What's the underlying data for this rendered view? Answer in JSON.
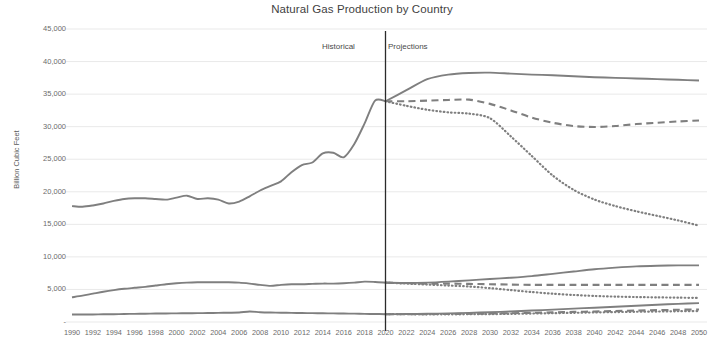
{
  "chart_data": {
    "type": "line",
    "title": "Natural Gas Production by Country",
    "xlabel": "",
    "ylabel": "Billion Cubic Feet",
    "ylim": [
      0,
      45000
    ],
    "xlim": [
      1990,
      2050
    ],
    "grid": true,
    "legend": "none",
    "y_ticks": [
      "45,000",
      "40,000",
      "35,000",
      "30,000",
      "25,000",
      "20,000",
      "15,000",
      "10,000",
      "5,000",
      "-"
    ],
    "y_tick_values": [
      45000,
      40000,
      35000,
      30000,
      25000,
      20000,
      15000,
      10000,
      5000,
      0
    ],
    "x_ticks": [
      "1990",
      "1992",
      "1994",
      "1996",
      "1998",
      "2000",
      "2002",
      "2004",
      "2006",
      "2008",
      "2010",
      "2012",
      "2014",
      "2016",
      "2018",
      "2020",
      "2022",
      "2024",
      "2026",
      "2028",
      "2030",
      "2032",
      "2034",
      "2036",
      "2038",
      "2040",
      "2042",
      "2044",
      "2046",
      "2048",
      "2050"
    ],
    "x_tick_values": [
      1990,
      1992,
      1994,
      1996,
      1998,
      2000,
      2002,
      2004,
      2006,
      2008,
      2010,
      2012,
      2014,
      2016,
      2018,
      2020,
      2022,
      2024,
      2026,
      2028,
      2030,
      2032,
      2034,
      2036,
      2038,
      2040,
      2042,
      2044,
      2046,
      2048,
      2050
    ],
    "annotations": [
      {
        "name": "historical-label",
        "text": "Historical",
        "x": 2016
      },
      {
        "name": "projections-label",
        "text": "Projections",
        "x": 2024
      },
      {
        "name": "era-divider",
        "text": "",
        "x": 2020
      }
    ],
    "divider_year": 2020,
    "line_color": "#7f7f7f",
    "grid_color": "#e9e9e9",
    "series": [
      {
        "name": "Country A historical",
        "style": "solid",
        "phase": "historical",
        "x": [
          1990,
          1991,
          1992,
          1993,
          1994,
          1995,
          1996,
          1997,
          1998,
          1999,
          2000,
          2001,
          2002,
          2003,
          2004,
          2005,
          2006,
          2007,
          2008,
          2009,
          2010,
          2011,
          2012,
          2013,
          2014,
          2015,
          2016,
          2017,
          2018,
          2019,
          2020
        ],
        "values": [
          17800,
          17700,
          17900,
          18200,
          18600,
          18900,
          19000,
          19000,
          18900,
          18800,
          19100,
          19400,
          18900,
          19000,
          18800,
          18200,
          18500,
          19300,
          20200,
          20900,
          21600,
          23000,
          24100,
          24500,
          25900,
          26000,
          25300,
          27300,
          30500,
          34000,
          33900
        ]
      },
      {
        "name": "Country A projection high",
        "style": "solid",
        "phase": "projection",
        "x": [
          2020,
          2022,
          2024,
          2026,
          2028,
          2030,
          2032,
          2034,
          2036,
          2038,
          2040,
          2042,
          2044,
          2046,
          2048,
          2050
        ],
        "values": [
          33900,
          35600,
          37300,
          38000,
          38250,
          38300,
          38150,
          38000,
          37900,
          37750,
          37600,
          37500,
          37400,
          37300,
          37200,
          37100
        ]
      },
      {
        "name": "Country A projection mid",
        "style": "dashed",
        "phase": "projection",
        "x": [
          2020,
          2022,
          2024,
          2026,
          2028,
          2030,
          2032,
          2034,
          2036,
          2038,
          2040,
          2042,
          2044,
          2046,
          2048,
          2050
        ],
        "values": [
          33900,
          33900,
          34000,
          34100,
          34150,
          33500,
          32500,
          31400,
          30600,
          30100,
          29950,
          30100,
          30400,
          30600,
          30800,
          30950
        ]
      },
      {
        "name": "Country A projection low",
        "style": "dotted",
        "phase": "projection",
        "x": [
          2020,
          2022,
          2024,
          2026,
          2028,
          2030,
          2032,
          2034,
          2036,
          2038,
          2040,
          2042,
          2044,
          2046,
          2048,
          2050
        ],
        "values": [
          33900,
          33200,
          32600,
          32200,
          32000,
          31300,
          28500,
          25500,
          22500,
          20300,
          18800,
          17800,
          17000,
          16300,
          15600,
          14800
        ]
      },
      {
        "name": "Country B historical",
        "style": "solid",
        "phase": "historical",
        "x": [
          1990,
          1991,
          1992,
          1993,
          1994,
          1995,
          1996,
          1997,
          1998,
          1999,
          2000,
          2001,
          2002,
          2003,
          2004,
          2005,
          2006,
          2007,
          2008,
          2009,
          2010,
          2011,
          2012,
          2013,
          2014,
          2015,
          2016,
          2017,
          2018,
          2019,
          2020
        ],
        "values": [
          3800,
          4050,
          4350,
          4650,
          4900,
          5100,
          5250,
          5400,
          5600,
          5800,
          5950,
          6050,
          6100,
          6100,
          6100,
          6100,
          6050,
          5900,
          5700,
          5550,
          5700,
          5800,
          5800,
          5850,
          5900,
          5900,
          5950,
          6050,
          6200,
          6150,
          6050
        ]
      },
      {
        "name": "Country B projection high",
        "style": "solid",
        "phase": "projection",
        "x": [
          2020,
          2022,
          2024,
          2026,
          2028,
          2030,
          2032,
          2034,
          2036,
          2038,
          2040,
          2042,
          2044,
          2046,
          2048,
          2050
        ],
        "values": [
          6050,
          6000,
          6050,
          6200,
          6400,
          6600,
          6800,
          7050,
          7400,
          7750,
          8100,
          8350,
          8550,
          8650,
          8700,
          8700
        ]
      },
      {
        "name": "Country B projection mid",
        "style": "dashed",
        "phase": "projection",
        "x": [
          2020,
          2022,
          2024,
          2026,
          2028,
          2030,
          2032,
          2034,
          2036,
          2038,
          2040,
          2042,
          2044,
          2046,
          2048,
          2050
        ],
        "values": [
          6050,
          5950,
          5900,
          5900,
          5850,
          5800,
          5750,
          5700,
          5700,
          5700,
          5700,
          5700,
          5700,
          5700,
          5700,
          5700
        ]
      },
      {
        "name": "Country B projection low",
        "style": "dotted",
        "phase": "projection",
        "x": [
          2020,
          2022,
          2024,
          2026,
          2028,
          2030,
          2032,
          2034,
          2036,
          2038,
          2040,
          2042,
          2044,
          2046,
          2048,
          2050
        ],
        "values": [
          6050,
          5900,
          5750,
          5600,
          5450,
          5200,
          4900,
          4600,
          4350,
          4150,
          4000,
          3900,
          3830,
          3780,
          3740,
          3700
        ]
      },
      {
        "name": "Country C historical",
        "style": "solid",
        "phase": "historical",
        "x": [
          1990,
          1991,
          1992,
          1993,
          1994,
          1995,
          1996,
          1997,
          1998,
          1999,
          2000,
          2001,
          2002,
          2003,
          2004,
          2005,
          2006,
          2007,
          2008,
          2009,
          2010,
          2011,
          2012,
          2013,
          2014,
          2015,
          2016,
          2017,
          2018,
          2019,
          2020
        ],
        "values": [
          1150,
          1150,
          1160,
          1180,
          1200,
          1230,
          1250,
          1270,
          1300,
          1310,
          1330,
          1350,
          1360,
          1380,
          1400,
          1420,
          1450,
          1620,
          1500,
          1450,
          1430,
          1400,
          1380,
          1360,
          1340,
          1320,
          1300,
          1280,
          1250,
          1230,
          1200
        ]
      },
      {
        "name": "Country C projection high",
        "style": "solid",
        "phase": "projection",
        "x": [
          2020,
          2022,
          2024,
          2026,
          2028,
          2030,
          2032,
          2034,
          2036,
          2038,
          2040,
          2042,
          2044,
          2046,
          2048,
          2050
        ],
        "values": [
          1200,
          1220,
          1260,
          1320,
          1400,
          1500,
          1620,
          1760,
          1900,
          2050,
          2200,
          2350,
          2500,
          2650,
          2780,
          2900
        ]
      },
      {
        "name": "Country C projection mid",
        "style": "dashed",
        "phase": "projection",
        "x": [
          2020,
          2022,
          2024,
          2026,
          2028,
          2030,
          2032,
          2034,
          2036,
          2038,
          2040,
          2042,
          2044,
          2046,
          2048,
          2050
        ],
        "values": [
          1200,
          1200,
          1210,
          1230,
          1260,
          1300,
          1350,
          1410,
          1480,
          1550,
          1620,
          1690,
          1760,
          1820,
          1880,
          1930
        ]
      },
      {
        "name": "Country C projection low",
        "style": "dotted",
        "phase": "projection",
        "x": [
          2020,
          2022,
          2024,
          2026,
          2028,
          2030,
          2032,
          2034,
          2036,
          2038,
          2040,
          2042,
          2044,
          2046,
          2048,
          2050
        ],
        "values": [
          1200,
          1190,
          1180,
          1180,
          1190,
          1210,
          1250,
          1300,
          1350,
          1410,
          1470,
          1520,
          1570,
          1610,
          1650,
          1680
        ]
      }
    ]
  }
}
